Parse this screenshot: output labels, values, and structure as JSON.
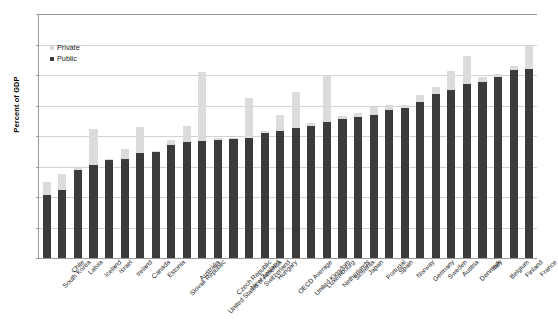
{
  "chart_data": {
    "type": "bar",
    "subtype": "stacked",
    "title": "",
    "xlabel": "",
    "ylabel": "Percent of GDP",
    "ylim": [
      0,
      40
    ],
    "ytick_step": 5,
    "yticks": [
      "0",
      "5",
      "10",
      "15",
      "20",
      "25",
      "30",
      "35",
      "40"
    ],
    "grid": true,
    "legend_position": "top-left-inside",
    "legend": [
      "Private",
      "Public"
    ],
    "colors": {
      "public": "#3b3b3b",
      "private": "#dcdcdc",
      "gridline": "#d2d2d2",
      "axis": "#9a9a9a",
      "text": "#1a1a1a"
    },
    "categories": [
      "South Korea",
      "Chile",
      "Latvia",
      "Iceland",
      "Israel",
      "Ireland",
      "Canada",
      "Estonia",
      "Slovak Republic",
      "Australia",
      "United States of America",
      "Czech Republic",
      "New Zealand",
      "Switzerland",
      "Hungary",
      "OECD Average",
      "United Kingdom",
      "Luxembourg",
      "Netherlands",
      "Slovenia",
      "Japan",
      "Portugal",
      "Spain",
      "Norway",
      "Germany",
      "Sweden",
      "Austria",
      "Denmark",
      "Italy",
      "Belgium",
      "Finland",
      "France"
    ],
    "series": [
      {
        "name": "Public",
        "values": [
          10.3,
          11.1,
          14.5,
          15.2,
          16.1,
          16.2,
          17.2,
          17.4,
          18.6,
          19.1,
          19.2,
          19.4,
          19.5,
          19.6,
          20.5,
          20.9,
          21.3,
          21.7,
          22.3,
          22.8,
          23.1,
          23.5,
          24.2,
          24.6,
          25.6,
          26.9,
          27.5,
          28.5,
          28.8,
          29.6,
          30.8,
          31.0
        ]
      },
      {
        "name": "Private",
        "values": [
          2.1,
          2.7,
          0.2,
          6.0,
          0.2,
          1.7,
          4.3,
          0.2,
          0.7,
          2.5,
          11.3,
          0.3,
          0.2,
          6.7,
          0.3,
          2.6,
          5.9,
          0.5,
          7.7,
          0.4,
          0.6,
          1.2,
          0.9,
          0.5,
          1.2,
          1.1,
          3.1,
          4.7,
          0.9,
          0.5,
          0.6,
          3.8
        ]
      }
    ],
    "totals": [
      12.4,
      13.8,
      14.7,
      21.2,
      16.3,
      17.9,
      21.5,
      17.6,
      19.3,
      21.6,
      30.5,
      19.7,
      19.7,
      26.3,
      20.8,
      23.5,
      27.2,
      22.2,
      30.0,
      23.2,
      23.7,
      24.7,
      25.1,
      25.1,
      26.8,
      28.0,
      30.6,
      33.2,
      29.7,
      30.1,
      31.4,
      34.8
    ]
  }
}
